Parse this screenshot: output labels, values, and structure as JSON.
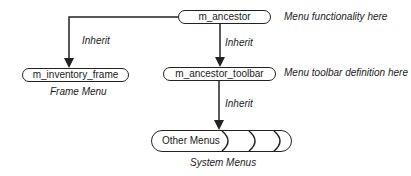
{
  "nodes": {
    "ancestor": "m_ancestor",
    "toolbar": "m_ancestor_toolbar",
    "inventory_frame": "m_inventory_frame",
    "other_menus": "Other Menus"
  },
  "annotations": {
    "ancestor_note": "Menu functionality here",
    "toolbar_note": "Menu toolbar definition here",
    "frame_caption": "Frame Menu",
    "system_caption": "System Menus"
  },
  "edges": {
    "inherit_left": "Inherit",
    "inherit_mid": "Inherit",
    "inherit_bottom": "Inherit"
  },
  "colors": {
    "stroke": "#222222",
    "text": "#1a1a1a",
    "background": "#ffffff"
  }
}
